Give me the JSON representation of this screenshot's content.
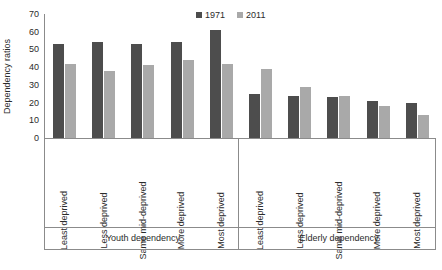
{
  "chart_data": {
    "type": "bar",
    "title": "",
    "xlabel": "",
    "ylabel": "Dependency ratios",
    "ylim": [
      0,
      70
    ],
    "yticks": [
      70,
      60,
      50,
      40,
      30,
      20,
      10,
      0
    ],
    "grid": false,
    "legend_position": "top-right",
    "categories": [
      "Least deprived",
      "Less deprived",
      "Same mid-deprived",
      "More deprived",
      "Most deprived",
      "Least deprived",
      "Less deprived",
      "Same mid-deprived",
      "More deprived",
      "Most deprived"
    ],
    "groups": [
      {
        "label": "Youth dependency",
        "categories": [
          "Least deprived",
          "Less deprived",
          "Same mid-deprived",
          "More deprived",
          "Most deprived"
        ]
      },
      {
        "label": "Elderly dependency",
        "categories": [
          "Least deprived",
          "Less deprived",
          "Same mid-deprived",
          "More deprived",
          "Most deprived"
        ]
      }
    ],
    "series": [
      {
        "name": "1971",
        "color": "#4d4d4d",
        "values": [
          53,
          54,
          53,
          54,
          61,
          25,
          24,
          23,
          21,
          20
        ]
      },
      {
        "name": "2011",
        "color": "#a9a9a9",
        "values": [
          42,
          38,
          41,
          44,
          42,
          39,
          29,
          24,
          18,
          13
        ]
      }
    ]
  },
  "legend": {
    "entries": [
      {
        "label": "1971",
        "color": "#4d4d4d"
      },
      {
        "label": "2011",
        "color": "#a9a9a9"
      }
    ]
  },
  "axes": {
    "y_title": "Dependency ratios"
  }
}
